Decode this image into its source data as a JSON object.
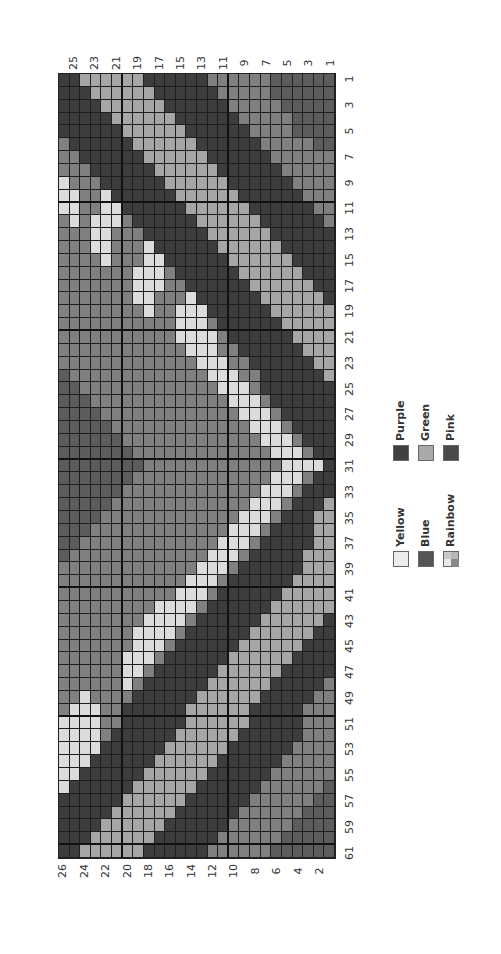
{
  "chart_data": {
    "type": "heatmap",
    "title": "CENTER FRONT",
    "orientation": "rotated -90deg",
    "stitch_labels": [
      "1",
      "3",
      "5",
      "7",
      "9",
      "11",
      "13",
      "15",
      "17",
      "19",
      "21",
      "23",
      "25",
      "27",
      "29",
      "31",
      "33",
      "35",
      "37",
      "39",
      "41",
      "43",
      "45",
      "47",
      "49",
      "51",
      "53",
      "55",
      "57",
      "59",
      "61"
    ],
    "row_labels_top": [
      "25",
      "23",
      "21",
      "19",
      "17",
      "15",
      "13",
      "11",
      "9",
      "7",
      "5",
      "3",
      "1"
    ],
    "row_labels_bottom": [
      "26",
      "24",
      "22",
      "20",
      "18",
      "16",
      "14",
      "12",
      "10",
      "8",
      "6",
      "4",
      "2"
    ],
    "n_stitches": 61,
    "n_rows": 26,
    "colors": {
      "P": "#3d3d3d",
      "K": "#4a4a4a",
      "B": "#5c5c5c",
      "R": "#808080",
      "G": "#a6a6a6",
      "Y": "#dcdcdc"
    },
    "legend": [
      {
        "key": "Y",
        "label": "Yellow",
        "swatch": "#ececec"
      },
      {
        "key": "B",
        "label": "Blue",
        "swatch": "#555555"
      },
      {
        "key": "R",
        "label": "Rainbow",
        "swatch": "rainbow"
      },
      {
        "key": "P",
        "label": "Purple",
        "swatch": "#404040"
      },
      {
        "key": "G",
        "label": "Green",
        "swatch": "#aaaaaa"
      },
      {
        "key": "K",
        "label": "Pink",
        "swatch": "#4a4a4a"
      }
    ],
    "grid_note": "Each string = one stitch (image row, top=stitch 1); characters left-to-right = chart rows 26 down to 1",
    "grid": [
      "PPGGGGGGPPPPPPRRRRRRBBBBBB",
      "PPPGGGGGGPPPPPPRRRRRBBBBBB",
      "PPPPGGGGGGPPPPPPRRRRRBBBBB",
      "PPPPPGGGGGGPPPPPPRRRRRBBBB",
      "PPPPPPGGGGGGPPPPPPRRRRBBBB",
      "RPPPPPPGGGGGGPPPPPPRRRRRBB",
      "RRPPPPPPGGGGGGPPPPPPRRRRRR",
      "RRRPPPPPPGGGGGGPPPPPPRRRRR",
      "YRRRPPPPPPGGGGGGPPPPPPRRRR",
      "YYRRYPPPPPPGGGGGGPPPPPPRRR",
      "YYRRYYPPPPPPGGGGGGPPPPPPRR",
      "RYRYYYRPPPPPPGGGGGGPPPPPPR",
      "RRRYYRRRPPPPPPGGGGGGPPPPPP",
      "RRRYYRRRYPPPPPPGGGGGGPPPPP",
      "RRRRYRRRYYPPPPPPGGGGGGPPPP",
      "RRRRRRRYYYRPPPPPPGGGGGGPPP",
      "RRRRRRRYYYRRPPPPPPGGGGGGPP",
      "RRRRRRRYYRRRYPPPPPPGGGGGGP",
      "RRRRRRRRYRRYYYPPPPPPGGGGGG",
      "RRRRRRRRRRRYYYRPPPPPPGGGGG",
      "RRRRRRRRRRRYYYYRPPPPPPGGGG",
      "RRRRRRRRRRRRYYYRRPPPPPPGGG",
      "RRRRRRRRRRRRRYYYRRPPPPPPGG",
      "BRRRRRRRRRRRRRYYYRRPPPPPPG",
      "BBRRRRRRRRRRRRRYYYRPPPPPPP",
      "BBBRRRRRRRRRRRRRYYYRPPPPPP",
      "BBBBRRRRRRRRRRRRRYYYRPPPPP",
      "BBBBBRRRRRRRRRRRRRYYYRPPPP",
      "BBBBBBRRRRRRRRRRRRRYYYRPPP",
      "BBBBBBBRRRRRRRRRRRRRYYYRPP",
      "BBBBBBBBRRRRRRRRRRRRRYYYYP",
      "BBBBBBBRRRRRRRRRRRRRYYYRPP",
      "BBBBBBRRRRRRRRRRRRRYYYRPPP",
      "BBBBBRRRRRRRRRRRRRYYYRPPPG",
      "BBBBRRRRRRRRRRRRRYYYRPPPGG",
      "BBBRRRRRRRRRRRRRYYYRPPPPGG",
      "BBRRRRRRRRRRRRRYYYRPPPPPGG",
      "BRRRRRRRRRRRRRYYYRPPPPPGGG",
      "RRRRRRRRRRRRRYYYRPPPPPPGGG",
      "RRRRRRRRRRRRYYYRPPPPPPGGGG",
      "RRRRRRRRRRRYYYRPPPPPPGGGGG",
      "RRRRRRRRRYYYYRPPPPPPGGGGGG",
      "RRRRRRRRYYYYRPPPPPPGGGGGGP",
      "RRRRRRRYYYYRPPPPPPGGGGGGPP",
      "RRRRRRRYYYRPPPPPPGGGGGGPPP",
      "RRRRRRYYYRPPPPPPGGGGGGPPPP",
      "RRRRRRYYRPPPPPPGGGGGGPPPPP",
      "RRRRRRYRPPPPPPGGGGGGPPPPPR",
      "RRYRRRRPPPPPPGGGGGGPPPPPRR",
      "RYYYRRPPPPPPGGGGGGPPPPPRRR",
      "YYYYRRPPPPPPGGGGGGPPPPPRRR",
      "YYYYRPPPPPPGGGGGGPPPPPPRRR",
      "YYYYPPPPPPGGGGGGPPPPPPRRRR",
      "YYYPPPPPPGGGGGGPPPPPPRRRRR",
      "YYPPPPPPGGGGGGPPPPPPRRRRRR",
      "YPPPPPPGGGGGGPPPPPPRRRRRRB",
      "PPPPPPGGGGGGPPPPPPRRRRRRBB",
      "PPPPPGGGGGGPPPPPPRRRRRRBBB",
      "PPPPGGGGGGPPPPPPRRRRRRBBBB",
      "PPPGGGGGGPPPPPPRRRRRRBBBBB",
      "PPGGGGGGPPPPPPRRRRRRBBBBBB"
    ]
  },
  "labels": {
    "center_front": "CENTER FRONT"
  }
}
